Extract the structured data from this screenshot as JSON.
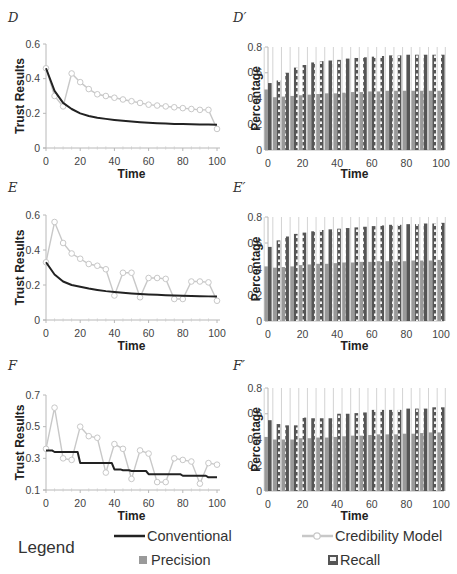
{
  "colors": {
    "conventional": "#222222",
    "credibility": "#c8c8c8",
    "precision": "#9a9a9a",
    "recall": "#555555",
    "axis": "#b8b8b8",
    "gridline": "#c8c8c8"
  },
  "legend": {
    "title": "Legend",
    "conventional": "Conventional",
    "credibility": "Credibility Model",
    "precision": "Precision",
    "recall": "Recall"
  },
  "chart_data": [
    {
      "id": "D",
      "label": "D",
      "type": "line",
      "xlabel": "Time",
      "ylabel": "Trust Results",
      "xlim": [
        0,
        100
      ],
      "ylim": [
        0,
        0.6
      ],
      "xticks": [
        0,
        20,
        40,
        60,
        80,
        100
      ],
      "yticks": [
        "0",
        "0.2",
        "0.4",
        "0.6"
      ],
      "series": [
        {
          "name": "Conventional",
          "x": [
            0,
            5,
            10,
            15,
            20,
            25,
            30,
            35,
            40,
            45,
            50,
            55,
            60,
            65,
            70,
            75,
            80,
            85,
            90,
            95,
            100
          ],
          "values": [
            0.46,
            0.33,
            0.26,
            0.225,
            0.2,
            0.185,
            0.175,
            0.168,
            0.162,
            0.157,
            0.153,
            0.149,
            0.146,
            0.143,
            0.141,
            0.139,
            0.138,
            0.137,
            0.136,
            0.135,
            0.134
          ]
        },
        {
          "name": "Credibility Model",
          "x": [
            0,
            5,
            10,
            15,
            20,
            25,
            30,
            35,
            40,
            45,
            50,
            55,
            60,
            65,
            70,
            75,
            80,
            85,
            90,
            95,
            100
          ],
          "values": [
            0.46,
            0.3,
            0.24,
            0.43,
            0.38,
            0.34,
            0.31,
            0.3,
            0.29,
            0.28,
            0.27,
            0.26,
            0.25,
            0.245,
            0.24,
            0.235,
            0.23,
            0.225,
            0.22,
            0.22,
            0.11
          ]
        }
      ]
    },
    {
      "id": "D_prime",
      "label": "D′",
      "type": "bar",
      "xlabel": "Time",
      "ylabel": "Percentage",
      "xlim": [
        0,
        100
      ],
      "ylim": [
        0,
        0.8
      ],
      "xticks": [
        0,
        20,
        40,
        60,
        80,
        100
      ],
      "yticks": [
        "0",
        "0.2",
        "0.4",
        "0.6",
        "0.8"
      ],
      "categories": [
        0,
        5,
        10,
        15,
        20,
        25,
        30,
        35,
        40,
        45,
        50,
        55,
        60,
        65,
        70,
        75,
        80,
        85,
        90,
        95,
        100
      ],
      "series": [
        {
          "name": "Precision",
          "values": [
            0.47,
            0.41,
            0.415,
            0.42,
            0.425,
            0.43,
            0.435,
            0.44,
            0.44,
            0.445,
            0.45,
            0.45,
            0.455,
            0.455,
            0.46,
            0.46,
            0.46,
            0.46,
            0.46,
            0.46,
            0.46
          ]
        },
        {
          "name": "Recall",
          "values": [
            0.52,
            0.54,
            0.6,
            0.64,
            0.66,
            0.68,
            0.69,
            0.695,
            0.7,
            0.71,
            0.715,
            0.72,
            0.725,
            0.73,
            0.735,
            0.735,
            0.74,
            0.74,
            0.74,
            0.74,
            0.74
          ]
        }
      ]
    },
    {
      "id": "E",
      "label": "E",
      "type": "line",
      "xlabel": "Time",
      "ylabel": "Trust Results",
      "xlim": [
        0,
        100
      ],
      "ylim": [
        0,
        0.6
      ],
      "xticks": [
        0,
        20,
        40,
        60,
        80,
        100
      ],
      "yticks": [
        "0",
        "0.2",
        "0.4",
        "0.6"
      ],
      "series": [
        {
          "name": "Conventional",
          "x": [
            0,
            5,
            10,
            15,
            20,
            25,
            30,
            35,
            40,
            45,
            50,
            55,
            60,
            65,
            70,
            75,
            80,
            85,
            90,
            95,
            100
          ],
          "values": [
            0.33,
            0.26,
            0.22,
            0.2,
            0.19,
            0.18,
            0.172,
            0.165,
            0.16,
            0.156,
            0.152,
            0.149,
            0.146,
            0.144,
            0.142,
            0.14,
            0.138,
            0.137,
            0.136,
            0.135,
            0.134
          ]
        },
        {
          "name": "Credibility Model",
          "x": [
            0,
            5,
            10,
            15,
            20,
            25,
            30,
            35,
            40,
            45,
            50,
            55,
            60,
            65,
            70,
            75,
            80,
            85,
            90,
            95,
            100
          ],
          "values": [
            0.33,
            0.56,
            0.44,
            0.38,
            0.35,
            0.32,
            0.31,
            0.29,
            0.14,
            0.27,
            0.27,
            0.13,
            0.24,
            0.24,
            0.235,
            0.12,
            0.12,
            0.22,
            0.22,
            0.215,
            0.11
          ]
        }
      ]
    },
    {
      "id": "E_prime",
      "label": "E′",
      "type": "bar",
      "xlabel": "Time",
      "ylabel": "Percentage",
      "xlim": [
        0,
        100
      ],
      "ylim": [
        0,
        0.8
      ],
      "xticks": [
        0,
        20,
        40,
        60,
        80,
        100
      ],
      "yticks": [
        "0",
        "0.2",
        "0.4",
        "0.6",
        "0.8"
      ],
      "categories": [
        0,
        5,
        10,
        15,
        20,
        25,
        30,
        35,
        40,
        45,
        50,
        55,
        60,
        65,
        70,
        75,
        80,
        85,
        90,
        95,
        100
      ],
      "series": [
        {
          "name": "Precision",
          "values": [
            0.42,
            0.41,
            0.415,
            0.42,
            0.43,
            0.435,
            0.44,
            0.44,
            0.445,
            0.45,
            0.45,
            0.455,
            0.455,
            0.46,
            0.46,
            0.46,
            0.46,
            0.465,
            0.465,
            0.465,
            0.47
          ]
        },
        {
          "name": "Recall",
          "values": [
            0.57,
            0.62,
            0.65,
            0.67,
            0.68,
            0.69,
            0.7,
            0.705,
            0.71,
            0.715,
            0.72,
            0.725,
            0.73,
            0.735,
            0.74,
            0.74,
            0.745,
            0.745,
            0.75,
            0.75,
            0.755
          ]
        }
      ]
    },
    {
      "id": "F",
      "label": "F",
      "type": "line",
      "xlabel": "Time",
      "ylabel": "Trust Results",
      "xlim": [
        0,
        100
      ],
      "ylim": [
        0.1,
        0.7
      ],
      "xticks": [
        0,
        20,
        40,
        60,
        80,
        100
      ],
      "yticks": [
        "0.1",
        "0.3",
        "0.5",
        "0.7"
      ],
      "series": [
        {
          "name": "Conventional",
          "x": [
            0,
            5,
            10,
            15,
            20,
            25,
            30,
            35,
            40,
            45,
            50,
            55,
            60,
            65,
            70,
            75,
            80,
            85,
            90,
            95,
            100
          ],
          "values": [
            0.35,
            0.34,
            0.34,
            0.34,
            0.27,
            0.27,
            0.27,
            0.27,
            0.23,
            0.225,
            0.22,
            0.22,
            0.2,
            0.2,
            0.2,
            0.2,
            0.19,
            0.19,
            0.19,
            0.18,
            0.18
          ]
        },
        {
          "name": "Credibility Model",
          "x": [
            0,
            5,
            10,
            15,
            20,
            25,
            30,
            35,
            40,
            45,
            50,
            55,
            60,
            65,
            70,
            75,
            80,
            85,
            90,
            95,
            100
          ],
          "values": [
            0.36,
            0.62,
            0.3,
            0.29,
            0.5,
            0.44,
            0.43,
            0.21,
            0.39,
            0.36,
            0.17,
            0.35,
            0.33,
            0.15,
            0.15,
            0.3,
            0.29,
            0.28,
            0.14,
            0.27,
            0.26
          ]
        }
      ]
    },
    {
      "id": "F_prime",
      "label": "F′",
      "type": "bar",
      "xlabel": "Time",
      "ylabel": "Percentage",
      "xlim": [
        0,
        100
      ],
      "ylim": [
        0,
        0.8
      ],
      "xticks": [
        0,
        20,
        40,
        60,
        80,
        100
      ],
      "yticks": [
        "0",
        "0.2",
        "0.4",
        "0.6",
        "0.8"
      ],
      "categories": [
        0,
        5,
        10,
        15,
        20,
        25,
        30,
        35,
        40,
        45,
        50,
        55,
        60,
        65,
        70,
        75,
        80,
        85,
        90,
        95,
        100
      ],
      "series": [
        {
          "name": "Precision",
          "values": [
            0.42,
            0.4,
            0.4,
            0.4,
            0.41,
            0.41,
            0.415,
            0.415,
            0.42,
            0.425,
            0.43,
            0.43,
            0.435,
            0.44,
            0.44,
            0.44,
            0.445,
            0.445,
            0.45,
            0.455,
            0.455
          ]
        },
        {
          "name": "Recall",
          "values": [
            0.55,
            0.52,
            0.51,
            0.51,
            0.57,
            0.565,
            0.565,
            0.565,
            0.6,
            0.6,
            0.605,
            0.61,
            0.63,
            0.63,
            0.63,
            0.63,
            0.64,
            0.64,
            0.64,
            0.65,
            0.65
          ]
        }
      ]
    }
  ]
}
